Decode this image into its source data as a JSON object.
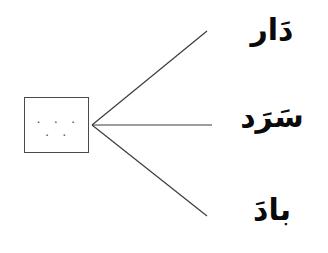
{
  "worksheet": {
    "background_color": "#ffffff",
    "line_color": "#3c3c3c",
    "box": {
      "label": "blank-answer-box",
      "dots": ". . . . .",
      "border_color": "#4a4a4a",
      "fill_color": "#ffffff"
    },
    "connectors": [
      {
        "name": "connector-line-top",
        "x1": 92,
        "y1": 125,
        "x2": 207,
        "y2": 31
      },
      {
        "name": "connector-line-middle",
        "x1": 92,
        "y1": 125,
        "x2": 212,
        "y2": 125
      },
      {
        "name": "connector-line-bottom",
        "x1": 92,
        "y1": 125,
        "x2": 207,
        "y2": 216
      }
    ],
    "choices": [
      {
        "word": "دَار",
        "transliteration": "dār"
      },
      {
        "word": "سَرَد",
        "transliteration": "sarad"
      },
      {
        "word": "بادَ",
        "transliteration": "bāda"
      }
    ]
  }
}
